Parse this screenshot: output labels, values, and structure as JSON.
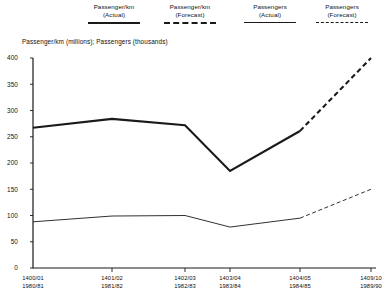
{
  "legend": {
    "items": [
      {
        "label": "Passenger/km\n(Actual)",
        "style": "thick-solid",
        "name": "legend-passenger-km-actual"
      },
      {
        "label": "Passenger/km\n(Forecast)",
        "style": "thick-dashed",
        "name": "legend-passenger-km-forecast"
      },
      {
        "label": "Passengers\n(Actual)",
        "style": "thin-solid",
        "name": "legend-passengers-actual"
      },
      {
        "label": "Passengers\n(Forecast)",
        "style": "thin-dashed",
        "name": "legend-passengers-forecast"
      }
    ]
  },
  "chart_data": {
    "type": "line",
    "title": "",
    "subtitle": "Passenger/km (millions); Passengers (thousands)",
    "xlabel": "",
    "ylabel": "",
    "ylim": [
      0,
      400
    ],
    "ytick_values": [
      0,
      50,
      100,
      150,
      200,
      250,
      300,
      350,
      400
    ],
    "ytick_labels": [
      "0",
      "50",
      "100",
      "150",
      "200",
      "250",
      "300",
      "350",
      "400"
    ],
    "grid": false,
    "legend_position": "top",
    "categories": [
      "1400/01 1980/81",
      "1401/02 1981/82",
      "1402/03 1982/83",
      "1403/04 1983/84",
      "1404/05 1984/85",
      "1409/10 1989/90"
    ],
    "xtick_labels": [
      {
        "top": "1400/01",
        "bottom": "1980/81"
      },
      {
        "top": "1401/02",
        "bottom": "1981/82"
      },
      {
        "top": "1402/03",
        "bottom": "1982/83"
      },
      {
        "top": "1403/04",
        "bottom": "1983/84"
      },
      {
        "top": "1404/05",
        "bottom": "1984/85"
      },
      {
        "top": "1409/10",
        "bottom": "1989/90"
      }
    ],
    "series": [
      {
        "name": "Passenger/km (Actual)",
        "unit": "millions",
        "style": "thick-solid",
        "x": [
          "1400/01",
          "1401/02",
          "1402/03",
          "1403/04",
          "1404/05"
        ],
        "values": [
          267,
          284,
          272,
          185,
          261
        ]
      },
      {
        "name": "Passenger/km (Forecast)",
        "unit": "millions",
        "style": "thick-dashed",
        "x": [
          "1404/05",
          "1409/10"
        ],
        "values": [
          261,
          400
        ]
      },
      {
        "name": "Passengers (Actual)",
        "unit": "thousands",
        "style": "thin-solid",
        "x": [
          "1400/01",
          "1401/02",
          "1402/03",
          "1403/04",
          "1404/05"
        ],
        "values": [
          88,
          99,
          100,
          78,
          95
        ]
      },
      {
        "name": "Passengers (Forecast)",
        "unit": "thousands",
        "style": "thin-dashed",
        "x": [
          "1404/05",
          "1409/10"
        ],
        "values": [
          95,
          150
        ]
      }
    ]
  }
}
